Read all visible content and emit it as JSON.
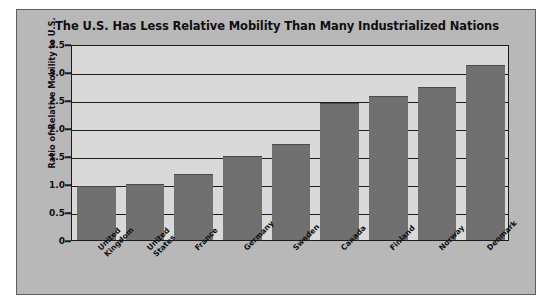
{
  "chart_data": {
    "type": "bar",
    "title": "The U.S. Has Less Relative Mobility Than Many Industrialized Nations",
    "xlabel": "",
    "ylabel": "Ratio of Relative Mobility to U.S.",
    "categories": [
      "United\nKingdom",
      "United\nStates",
      "France",
      "Germany",
      "Sweden",
      "Canada",
      "Finland",
      "Norway",
      "Denmark"
    ],
    "values": [
      0.96,
      1.0,
      1.17,
      1.5,
      1.72,
      2.45,
      2.57,
      2.74,
      3.12
    ],
    "ylim": [
      0,
      3.5
    ],
    "ytick_labels": [
      "3.5",
      "3.0",
      "2.5",
      "2.0",
      "1.5",
      "1.0",
      "0.5",
      "0"
    ],
    "ytick_values": [
      3.5,
      3.0,
      2.5,
      2.0,
      1.5,
      1.0,
      0.5,
      0
    ],
    "grid": true,
    "legend": "none",
    "colors": {
      "bar_fill": "#707070",
      "plot_background": "#d9d9d9",
      "panel_background": "#b8b8b8",
      "axis": "#1c1c1c",
      "text": "#101010"
    }
  }
}
